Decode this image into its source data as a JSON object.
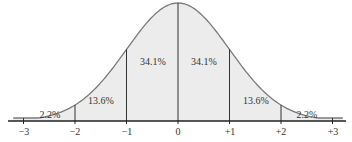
{
  "chart_data": {
    "type": "area",
    "title": "",
    "xlabel": "",
    "ylabel": "",
    "distribution": "normal",
    "tick_labels": [
      "−3",
      "−2",
      "−1",
      "0",
      "+1",
      "+2",
      "+3"
    ],
    "tick_values": [
      -3,
      -2,
      -1,
      0,
      1,
      2,
      3
    ],
    "regions": [
      {
        "from": -3,
        "to": -2,
        "label": "2.2%",
        "value": 2.2
      },
      {
        "from": -2,
        "to": -1,
        "label": "13.6%",
        "value": 13.6
      },
      {
        "from": -1,
        "to": 0,
        "label": "34.1%",
        "value": 34.1
      },
      {
        "from": 0,
        "to": 1,
        "label": "34.1%",
        "value": 34.1
      },
      {
        "from": 1,
        "to": 2,
        "label": "13.6%",
        "value": 13.6
      },
      {
        "from": 2,
        "to": 3,
        "label": "2.2%",
        "value": 2.2
      }
    ],
    "grid": false,
    "legend": "none"
  },
  "colors": {
    "fill": "#ececec",
    "curve": "#7a7a7a",
    "axis": "#222222",
    "divider": "#333333",
    "text": "#333333"
  },
  "labels": {
    "r0": "2.2%",
    "r1": "13.6%",
    "r2": "34.1%",
    "r3": "34.1%",
    "r4": "13.6%",
    "r5": "2.2%",
    "t0": "−3",
    "t1": "−2",
    "t2": "−1",
    "t3": "0",
    "t4": "+1",
    "t5": "+2",
    "t6": "+3"
  }
}
